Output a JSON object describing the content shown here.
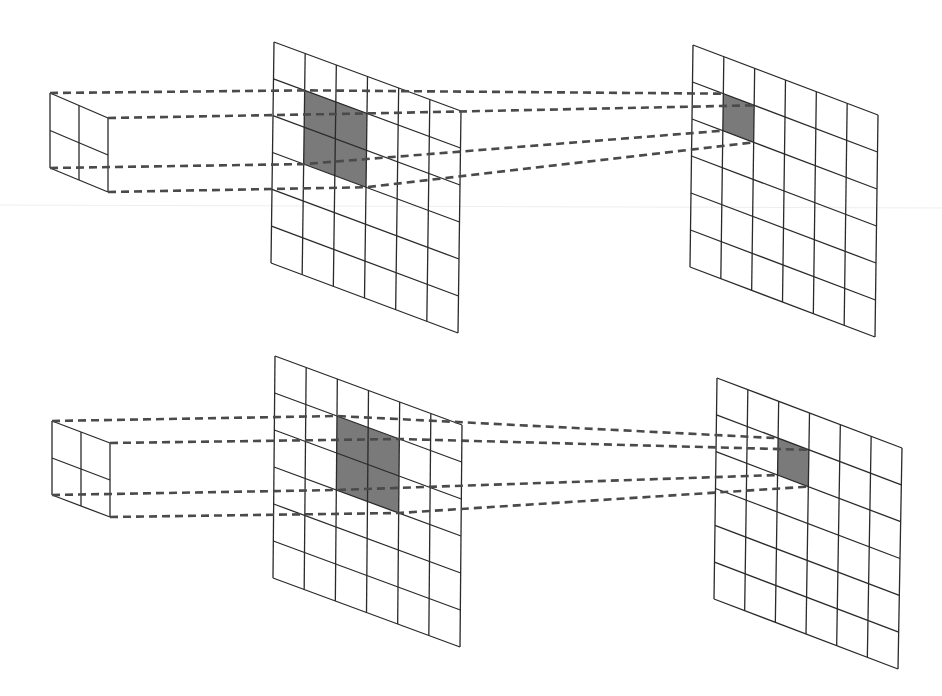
{
  "diagram": {
    "title": "",
    "colors": {
      "line": "#2a2a2a",
      "dash": "#4a4a4a",
      "shade": "#7a7a7a",
      "background": "#ffffff"
    },
    "panels": [
      {
        "name": "top",
        "kernel": {
          "rows": 2,
          "cols": 2,
          "tl": [
            50,
            93
          ],
          "tr": [
            108,
            118
          ],
          "bl": [
            50,
            168
          ],
          "br": [
            108,
            192
          ]
        },
        "input": {
          "rows": 6,
          "cols": 6,
          "tl": [
            274,
            42
          ],
          "tr": [
            461,
            111
          ],
          "bl": [
            271,
            263
          ],
          "br": [
            458,
            333
          ],
          "shaded": {
            "row": 1,
            "col": 1,
            "rows": 2,
            "cols": 2
          }
        },
        "output": {
          "rows": 6,
          "cols": 6,
          "tl": [
            693,
            45
          ],
          "tr": [
            878,
            115
          ],
          "bl": [
            690,
            267
          ],
          "br": [
            875,
            337
          ],
          "shaded": {
            "row": 1,
            "col": 1,
            "rows": 1,
            "cols": 1
          }
        }
      },
      {
        "name": "bottom",
        "kernel": {
          "rows": 2,
          "cols": 2,
          "tl": [
            52,
            421
          ],
          "tr": [
            110,
            443
          ],
          "bl": [
            52,
            495
          ],
          "br": [
            110,
            517
          ]
        },
        "input": {
          "rows": 6,
          "cols": 6,
          "tl": [
            275,
            356
          ],
          "tr": [
            462,
            425
          ],
          "bl": [
            273,
            578
          ],
          "br": [
            460,
            647
          ],
          "shaded": {
            "row": 1,
            "col": 2,
            "rows": 2,
            "cols": 2
          }
        },
        "output": {
          "rows": 6,
          "cols": 6,
          "tl": [
            717,
            378
          ],
          "tr": [
            902,
            448
          ],
          "bl": [
            714,
            599
          ],
          "br": [
            898,
            669
          ],
          "shaded": {
            "row": 1,
            "col": 2,
            "rows": 1,
            "cols": 1
          }
        }
      }
    ]
  }
}
